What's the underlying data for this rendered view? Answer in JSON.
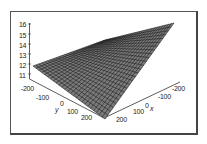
{
  "chart_data": {
    "type": "surface3d",
    "title": "",
    "xlabel": "x",
    "ylabel": "y",
    "zlabel": "",
    "x_ticks": [
      "-200",
      "-100",
      "0",
      "100",
      "200"
    ],
    "y_ticks": [
      "-200",
      "-100",
      "0",
      "100",
      "200"
    ],
    "z_ticks": [
      "11",
      "12",
      "13",
      "14",
      "15",
      "16"
    ],
    "xlim": [
      -200,
      200
    ],
    "ylim": [
      -200,
      200
    ],
    "zlim": [
      11,
      16
    ],
    "grid_lines": 25,
    "surface": {
      "description": "planar wireframe mesh rising from ~11.5 to ~16.3",
      "corners": [
        {
          "x": -200,
          "y": -200,
          "z": 11.8
        },
        {
          "x": -200,
          "y": 200,
          "z": 16.3
        },
        {
          "x": 200,
          "y": 200,
          "z": 11.3
        },
        {
          "x": 200,
          "y": -200,
          "z": 15.0
        }
      ]
    },
    "mesh_color": "#1a1a1a"
  },
  "axes": {
    "z_ticks": [
      "16",
      "15",
      "14",
      "13",
      "12",
      "11"
    ],
    "y_ticks": [
      "-200",
      "-100",
      "0",
      "100",
      "200"
    ],
    "x_ticks": [
      "-200",
      "-100",
      "0",
      "100",
      "200"
    ],
    "y_label": "y",
    "x_label": "x"
  }
}
